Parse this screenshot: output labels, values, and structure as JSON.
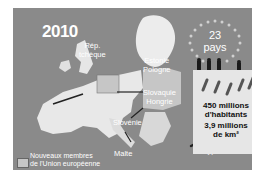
{
  "infographic": {
    "year": "2010",
    "member_count": "23",
    "member_unit": "pays",
    "labels": {
      "czech": "Rép.\ntchèque",
      "estonia_poland": "Estonie\nPologne",
      "slovakia_hungary": "Slovaquie\nHongrie",
      "slovenia": "Slovénie",
      "malta": "Malte",
      "cyprus": "Chypre"
    },
    "stats": {
      "population": "450 millions\nd'habitants",
      "area": "3,9 millions\nde km²"
    },
    "legend": {
      "label": "Nouveaux membres\nde l'Union européenne",
      "swatch_color": "#c6c6c6"
    },
    "colors": {
      "background": "#8a8a8a",
      "land": "#e8e8e8",
      "new_members": "#c6c6c6",
      "border": "#222222",
      "text": "#ffffff"
    }
  }
}
